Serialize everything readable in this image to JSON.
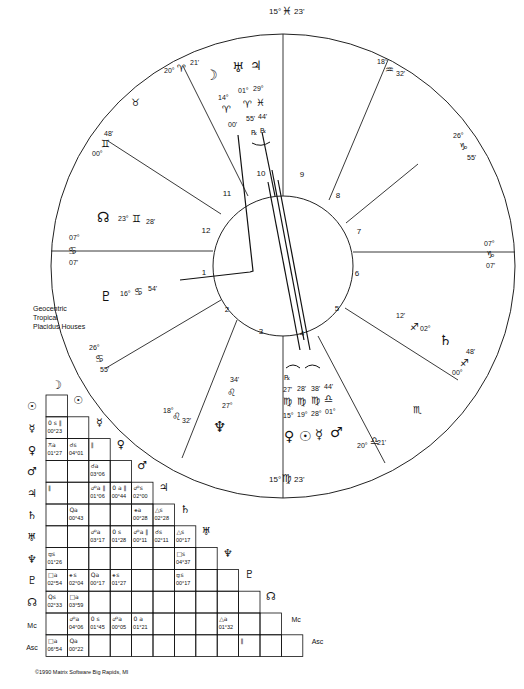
{
  "chart": {
    "info_lines": [
      "Geocentric",
      "Tropical",
      "Placidus Houses"
    ],
    "copyright": "©1990 Matrix Software Big Rapids, MI",
    "house_numbers": [
      "1",
      "2",
      "3",
      "4",
      "5",
      "6",
      "7",
      "8",
      "9",
      "10",
      "11",
      "12"
    ],
    "cusps": [
      {
        "house": "10",
        "deg": "15°",
        "sign": "♓",
        "min": "23'"
      },
      {
        "house": "11",
        "deg": "20°",
        "sign": "♈",
        "min": "21'"
      },
      {
        "house": "12",
        "deg": "00°",
        "sign": "♊",
        "min": "48'"
      },
      {
        "house": "1",
        "deg": "07°",
        "sign": "♋",
        "min": "07'"
      },
      {
        "house": "2",
        "deg": "26°",
        "sign": "♋",
        "min": "55'"
      },
      {
        "house": "3",
        "deg": "18°",
        "sign": "♌",
        "min": "32'"
      },
      {
        "house": "4",
        "deg": "15°",
        "sign": "♍",
        "min": "23'"
      },
      {
        "house": "5",
        "deg": "20°",
        "sign": "♎",
        "min": "21'"
      },
      {
        "house": "6",
        "deg": "00°",
        "sign": "♐",
        "min": "48'"
      },
      {
        "house": "7",
        "deg": "07°",
        "sign": "♑",
        "min": "07'"
      },
      {
        "house": "8",
        "deg": "26°",
        "sign": "♑",
        "min": "55'"
      },
      {
        "house": "9",
        "deg": "18°",
        "sign": "♒",
        "min": "32'"
      }
    ],
    "intercepted_signs": [
      {
        "sign": "♉"
      },
      {
        "sign": "♏"
      }
    ],
    "planets": {
      "moon": {
        "glyph": "☽",
        "deg": "14°",
        "sign": "♈",
        "min": "00'"
      },
      "uranus": {
        "glyph": "♅",
        "deg": "01°",
        "sign": "♈",
        "min": "55'",
        "retro": "℞"
      },
      "jupiter": {
        "glyph": "♃",
        "deg": "29°",
        "sign": "♓",
        "min": "44'",
        "retro": "℞"
      },
      "node": {
        "glyph": "☊",
        "deg": "23°",
        "sign": "♊",
        "min": "28'"
      },
      "pluto": {
        "glyph": "♇",
        "deg": "16°",
        "sign": "♋",
        "min": "54'"
      },
      "neptune": {
        "glyph": "♆",
        "deg": "27°",
        "sign": "♌",
        "min": "34'"
      },
      "venus": {
        "glyph": "♀",
        "deg": "15°",
        "sign": "♍",
        "min": "27'",
        "retro": "℞"
      },
      "sun": {
        "glyph": "☉",
        "deg": "19°",
        "sign": "♍",
        "min": "28'"
      },
      "mercury": {
        "glyph": "☿",
        "deg": "28°",
        "sign": "♍",
        "min": "38'"
      },
      "mars": {
        "glyph": "♂",
        "deg": "01°",
        "sign": "♎",
        "min": "44'"
      },
      "saturn": {
        "glyph": "♄",
        "deg": "02°",
        "sign": "♐",
        "min": "12'"
      }
    }
  },
  "aspect_grid": {
    "headers": [
      "☽",
      "☉",
      "☿",
      "♀",
      "♂",
      "♃",
      "♄",
      "♅",
      "♆",
      "♇",
      "☊",
      "Mc",
      "Asc"
    ],
    "rows": [
      {
        "label": "☉",
        "cells": [
          {
            "a": "",
            "v": ""
          }
        ]
      },
      {
        "label": "☿",
        "cells": [
          {
            "a": "0 s ∥",
            "v": "00°23"
          },
          {
            "a": "",
            "v": ""
          }
        ]
      },
      {
        "label": "♀",
        "cells": [
          {
            "a": "⚻a",
            "v": "01°27"
          },
          {
            "a": "☌s",
            "v": "04°01"
          },
          {
            "a": "∥",
            "v": ""
          }
        ]
      },
      {
        "label": "♂",
        "cells": [
          {
            "a": "",
            "v": ""
          },
          {
            "a": "",
            "v": ""
          },
          {
            "a": "☌a",
            "v": "03°06"
          },
          {
            "a": "",
            "v": ""
          }
        ]
      },
      {
        "label": "♃",
        "cells": [
          {
            "a": "∥",
            "v": ""
          },
          {
            "a": "",
            "v": ""
          },
          {
            "a": "☍a ∥",
            "v": "01°06"
          },
          {
            "a": "0 a ∥",
            "v": "00°44"
          },
          {
            "a": "☍s",
            "v": "02°00"
          }
        ]
      },
      {
        "label": "♄",
        "cells": [
          {
            "a": "",
            "v": ""
          },
          {
            "a": "Qa",
            "v": "00°43"
          },
          {
            "a": "",
            "v": ""
          },
          {
            "a": "",
            "v": ""
          },
          {
            "a": "⚹a",
            "v": "00°28"
          },
          {
            "a": "△s",
            "v": "02°28"
          }
        ]
      },
      {
        "label": "♅",
        "cells": [
          {
            "a": "",
            "v": ""
          },
          {
            "a": "",
            "v": ""
          },
          {
            "a": "☍a",
            "v": "03°17"
          },
          {
            "a": "0 s",
            "v": "01°28"
          },
          {
            "a": "☍a ∥",
            "v": "00°11"
          },
          {
            "a": "☌s",
            "v": "02°11"
          },
          {
            "a": "△s",
            "v": "00°17"
          }
        ]
      },
      {
        "label": "♆",
        "cells": [
          {
            "a": "⚼s",
            "v": "01°26"
          },
          {
            "a": "",
            "v": ""
          },
          {
            "a": "",
            "v": ""
          },
          {
            "a": "",
            "v": ""
          },
          {
            "a": "",
            "v": ""
          },
          {
            "a": "",
            "v": ""
          },
          {
            "a": "□s",
            "v": "04°37"
          },
          {
            "a": "",
            "v": ""
          }
        ]
      },
      {
        "label": "♇",
        "cells": [
          {
            "a": "□a",
            "v": "02°54"
          },
          {
            "a": "⚹s",
            "v": "02°04"
          },
          {
            "a": "Qa",
            "v": "00°17"
          },
          {
            "a": "⚹s",
            "v": "01°27"
          },
          {
            "a": "",
            "v": ""
          },
          {
            "a": "",
            "v": ""
          },
          {
            "a": "⚼s",
            "v": "00°17"
          },
          {
            "a": "",
            "v": ""
          },
          {
            "a": "",
            "v": ""
          }
        ]
      },
      {
        "label": "☊",
        "cells": [
          {
            "a": "Qs",
            "v": "02°33"
          },
          {
            "a": "□a",
            "v": "03°59"
          },
          {
            "a": "",
            "v": ""
          },
          {
            "a": "",
            "v": ""
          },
          {
            "a": "",
            "v": ""
          },
          {
            "a": "",
            "v": ""
          },
          {
            "a": "",
            "v": ""
          },
          {
            "a": "",
            "v": ""
          },
          {
            "a": "",
            "v": ""
          },
          {
            "a": "",
            "v": ""
          }
        ]
      },
      {
        "label": "Mc",
        "cells": [
          {
            "a": "",
            "v": ""
          },
          {
            "a": "☍a",
            "v": "04°06"
          },
          {
            "a": "0 s",
            "v": "01°45"
          },
          {
            "a": "☍a",
            "v": "00°05"
          },
          {
            "a": "0 a",
            "v": "01°21"
          },
          {
            "a": "",
            "v": ""
          },
          {
            "a": "",
            "v": ""
          },
          {
            "a": "",
            "v": ""
          },
          {
            "a": "△a",
            "v": "01°32"
          },
          {
            "a": "",
            "v": ""
          },
          {
            "a": "",
            "v": ""
          }
        ]
      },
      {
        "label": "Asc",
        "cells": [
          {
            "a": "□a",
            "v": "06°54"
          },
          {
            "a": "Qa",
            "v": "00°22"
          },
          {
            "a": "",
            "v": ""
          },
          {
            "a": "",
            "v": ""
          },
          {
            "a": "",
            "v": ""
          },
          {
            "a": "",
            "v": ""
          },
          {
            "a": "",
            "v": ""
          },
          {
            "a": "",
            "v": ""
          },
          {
            "a": "",
            "v": ""
          },
          {
            "a": "∥",
            "v": ""
          },
          {
            "a": "",
            "v": ""
          },
          {
            "a": "",
            "v": ""
          }
        ]
      }
    ]
  }
}
